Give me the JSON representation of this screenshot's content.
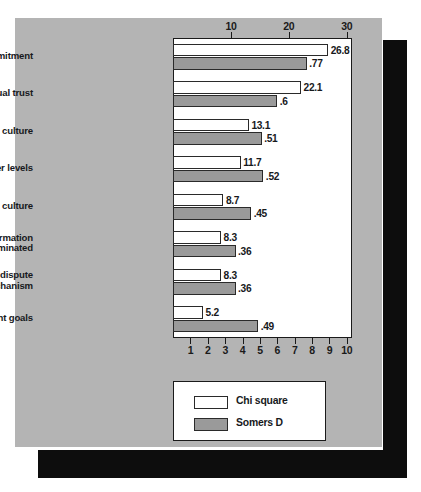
{
  "chart_data": {
    "type": "bar",
    "orientation": "horizontal",
    "title": "",
    "subtitle": "",
    "xlabel": "",
    "ylabel": "",
    "grid": false,
    "legend_position": "bottom-left",
    "categories": [
      "Top management commitment",
      "Mutual trust",
      "Sensitivity to company culture",
      "Commitment at lower levels",
      "Sensitivity to national culture",
      "Information\nwidely disseminated",
      "Good dispute\nresolution mechanism",
      "Congruent goals"
    ],
    "category_lines": [
      [
        "Top management commitment"
      ],
      [
        "Mutual trust"
      ],
      [
        "Sensitivity to company culture"
      ],
      [
        "Commitment at lower levels"
      ],
      [
        "Sensitivity to national culture"
      ],
      [
        "Information",
        "widely disseminated"
      ],
      [
        "Good dispute",
        "resolution mechanism"
      ],
      [
        "Congruent goals"
      ]
    ],
    "series": [
      {
        "name": "Chi square",
        "axis": "top",
        "color": "#ffffff",
        "values": [
          26.8,
          22.1,
          13.1,
          11.7,
          8.7,
          8.3,
          8.3,
          5.2
        ],
        "labels": [
          "26.8",
          "22.1",
          "13.1",
          "11.7",
          "8.7",
          "8.3",
          "8.3",
          "5.2"
        ]
      },
      {
        "name": "Somers D",
        "axis": "bottom",
        "color": "#9a9a9a",
        "values": [
          0.77,
          0.6,
          0.51,
          0.52,
          0.45,
          0.36,
          0.36,
          0.49
        ],
        "labels": [
          ".77",
          ".6",
          ".51",
          ".52",
          ".45",
          ".36",
          ".36",
          ".49"
        ]
      }
    ],
    "axis_top": {
      "label": "",
      "ticks": [
        10,
        20,
        30
      ],
      "tick_labels": [
        "10",
        "20",
        "30"
      ],
      "range": [
        0,
        30.9
      ]
    },
    "axis_bottom": {
      "label": "",
      "ticks": [
        1,
        2,
        3,
        4,
        5,
        6,
        7,
        8,
        9,
        10
      ],
      "tick_labels": [
        "1",
        "2",
        "3",
        "4",
        "5",
        "6",
        "7",
        "8",
        "9",
        "10"
      ],
      "range": [
        0,
        10.3
      ]
    },
    "legend": [
      {
        "label": "Chi square",
        "swatch": "white"
      },
      {
        "label": "Somers D",
        "swatch": "gray"
      }
    ],
    "colors": {
      "panel_background": "#b4b4b4",
      "plot_background": "#ffffff",
      "axis": "#1a1a1a",
      "chi_square_bar": "#ffffff",
      "somers_d_bar": "#9a9a9a",
      "shadow": "#0d0d0d",
      "text": "#17191c"
    }
  }
}
